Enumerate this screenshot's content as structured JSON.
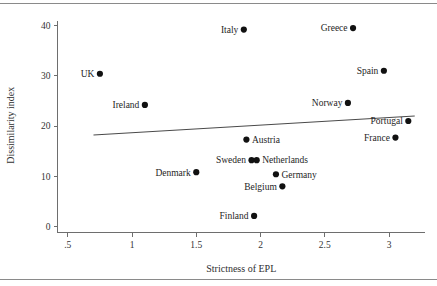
{
  "chart_data": {
    "type": "scatter",
    "title": "",
    "xlabel": "Strictness of EPL",
    "ylabel": "Dissimilarity index",
    "xlim": [
      0.42,
      3.28
    ],
    "ylim": [
      -1.2,
      41.5
    ],
    "xticks": [
      ".5",
      "1",
      "1.5",
      "2",
      "2.5",
      "3"
    ],
    "xtick_values": [
      0.5,
      1.0,
      1.5,
      2.0,
      2.5,
      3.0
    ],
    "yticks": [
      "0",
      "10",
      "20",
      "30",
      "40"
    ],
    "ytick_values": [
      0,
      10,
      20,
      30,
      40
    ],
    "grid": false,
    "legend": false,
    "points": [
      {
        "label": "Italy",
        "x": 1.87,
        "y": 39.2,
        "label_pos": "left"
      },
      {
        "label": "Greece",
        "x": 2.72,
        "y": 39.5,
        "label_pos": "left"
      },
      {
        "label": "UK",
        "x": 0.75,
        "y": 30.4,
        "label_pos": "left"
      },
      {
        "label": "Spain",
        "x": 2.96,
        "y": 31.0,
        "label_pos": "left"
      },
      {
        "label": "Ireland",
        "x": 1.1,
        "y": 24.2,
        "label_pos": "left"
      },
      {
        "label": "Norway",
        "x": 2.68,
        "y": 24.6,
        "label_pos": "left"
      },
      {
        "label": "Portugal",
        "x": 3.15,
        "y": 21.0,
        "label_pos": "left"
      },
      {
        "label": "France",
        "x": 3.05,
        "y": 17.7,
        "label_pos": "left"
      },
      {
        "label": "Austria",
        "x": 1.89,
        "y": 17.3,
        "label_pos": "right"
      },
      {
        "label": "Sweden",
        "x": 1.93,
        "y": 13.2,
        "label_pos": "left"
      },
      {
        "label": "Netherlands",
        "x": 1.97,
        "y": 13.2,
        "label_pos": "right"
      },
      {
        "label": "Denmark",
        "x": 1.5,
        "y": 10.8,
        "label_pos": "left"
      },
      {
        "label": "Germany",
        "x": 2.12,
        "y": 10.4,
        "label_pos": "right"
      },
      {
        "label": "Belgium",
        "x": 2.17,
        "y": 8.0,
        "label_pos": "left"
      },
      {
        "label": "Finland",
        "x": 1.95,
        "y": 2.1,
        "label_pos": "left"
      }
    ],
    "trendline": {
      "x_start": 0.7,
      "y_start": 18.2,
      "x_end": 3.2,
      "y_end": 22.0
    },
    "colors": {
      "point": "#111111",
      "trendline": "#4a4a4a",
      "axis": "#6e6e6e",
      "text": "#333333",
      "rule": "#8a8a8a",
      "background": "#ffffff"
    }
  }
}
